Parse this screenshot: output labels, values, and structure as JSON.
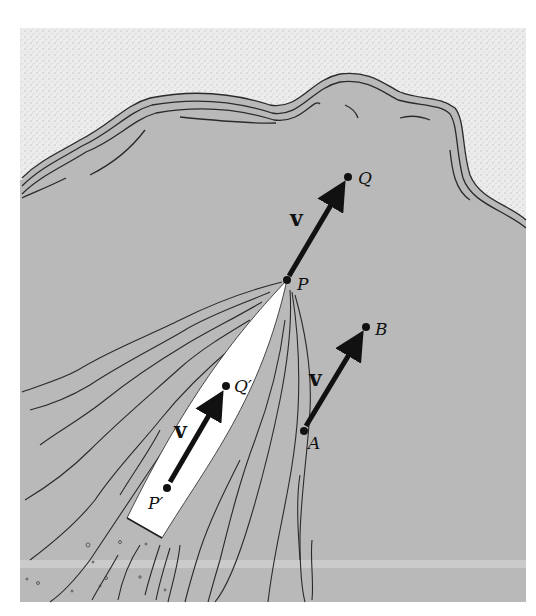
{
  "figure": {
    "colors": {
      "land": "#e6e6e6",
      "water": "#b9b9b9",
      "boat": "#ffffff",
      "ink": "#111111"
    }
  },
  "labels": {
    "P": "P",
    "Q": "Q",
    "A": "A",
    "B": "B",
    "P_prime": "P′",
    "Q_prime": "Q′",
    "v_PQ": "v",
    "v_AB": "v",
    "v_boat": "v"
  },
  "points": {
    "P": [
      287,
      280
    ],
    "Q": [
      348,
      177
    ],
    "A": [
      304,
      431
    ],
    "B": [
      366,
      327
    ],
    "P_prime": [
      167,
      488
    ],
    "Q_prime": [
      226,
      386
    ]
  }
}
